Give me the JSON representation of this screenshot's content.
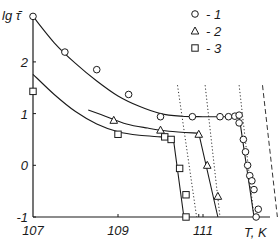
{
  "chart_data": {
    "type": "scatter",
    "title": "",
    "xlabel": "T, K",
    "ylabel": "lg τ̄",
    "xlim": [
      107,
      112.5
    ],
    "ylim": [
      -1,
      2.9
    ],
    "xticks": [
      107,
      109,
      111
    ],
    "xtick_labels": [
      "107",
      "109",
      "111"
    ],
    "yticks": [
      -1,
      0,
      1,
      2
    ],
    "ytick_labels": [
      "-1",
      "0",
      "1",
      "2"
    ],
    "grid": false,
    "legend_position": "top-right",
    "series": [
      {
        "name": "1",
        "marker": "circle",
        "points": [
          [
            107.0,
            2.88
          ],
          [
            107.75,
            2.19
          ],
          [
            108.5,
            1.85
          ],
          [
            109.25,
            1.37
          ],
          [
            110.0,
            0.94
          ],
          [
            110.75,
            0.94
          ],
          [
            111.4,
            0.94
          ],
          [
            111.6,
            0.94
          ],
          [
            111.75,
            0.95
          ],
          [
            111.85,
            0.97
          ],
          [
            111.85,
            0.82
          ],
          [
            111.95,
            0.5
          ],
          [
            112.0,
            0.26
          ],
          [
            112.05,
            0.0
          ],
          [
            112.1,
            -0.2
          ],
          [
            112.15,
            -0.3
          ],
          [
            112.2,
            -0.47
          ],
          [
            112.3,
            -0.85
          ],
          [
            112.25,
            -1.0
          ]
        ],
        "fit_curve": [
          [
            107.0,
            2.88
          ],
          [
            107.5,
            2.37
          ],
          [
            108.0,
            1.97
          ],
          [
            108.5,
            1.63
          ],
          [
            109.0,
            1.34
          ],
          [
            109.5,
            1.14
          ],
          [
            110.0,
            1.0
          ],
          [
            110.5,
            0.95
          ],
          [
            111.0,
            0.94
          ],
          [
            111.5,
            0.94
          ],
          [
            111.85,
            0.95
          ],
          [
            112.2,
            -1.0
          ]
        ]
      },
      {
        "name": "2",
        "marker": "triangle",
        "points": [
          [
            108.9,
            0.87
          ],
          [
            110.0,
            0.68
          ],
          [
            110.9,
            0.6
          ],
          [
            111.1,
            0.0
          ],
          [
            111.35,
            -0.6
          ]
        ],
        "fit_curve": [
          [
            108.3,
            1.07
          ],
          [
            108.7,
            0.95
          ],
          [
            109.2,
            0.8
          ],
          [
            109.7,
            0.72
          ],
          [
            110.2,
            0.66
          ],
          [
            110.9,
            0.62
          ],
          [
            111.35,
            -1.0
          ]
        ]
      },
      {
        "name": "3",
        "marker": "square",
        "points": [
          [
            107.0,
            1.43
          ],
          [
            109.0,
            0.6
          ],
          [
            110.1,
            0.55
          ],
          [
            110.25,
            0.5
          ],
          [
            110.45,
            -0.06
          ],
          [
            110.6,
            -0.57
          ],
          [
            110.6,
            -1.0
          ]
        ],
        "fit_curve": [
          [
            107.0,
            1.76
          ],
          [
            107.5,
            1.37
          ],
          [
            108.0,
            1.04
          ],
          [
            108.5,
            0.8
          ],
          [
            109.0,
            0.65
          ],
          [
            109.5,
            0.58
          ],
          [
            110.0,
            0.55
          ],
          [
            110.3,
            0.53
          ],
          [
            110.55,
            -1.0
          ]
        ]
      }
    ],
    "reference_lines": [
      {
        "style": "dotted",
        "from": [
          110.4,
          1.55
        ],
        "to": [
          110.85,
          -1.0
        ]
      },
      {
        "style": "dotted",
        "from": [
          111.05,
          1.55
        ],
        "to": [
          111.4,
          -1.0
        ]
      },
      {
        "style": "dotted",
        "from": [
          111.85,
          1.55
        ],
        "to": [
          112.2,
          -1.0
        ]
      },
      {
        "style": "dashed",
        "from": [
          112.4,
          1.55
        ],
        "to": [
          112.75,
          -1.0
        ]
      }
    ],
    "legend": [
      {
        "marker": "circle",
        "label": "- 1"
      },
      {
        "marker": "triangle",
        "label": "- 2"
      },
      {
        "marker": "square",
        "label": "- 3"
      }
    ]
  }
}
